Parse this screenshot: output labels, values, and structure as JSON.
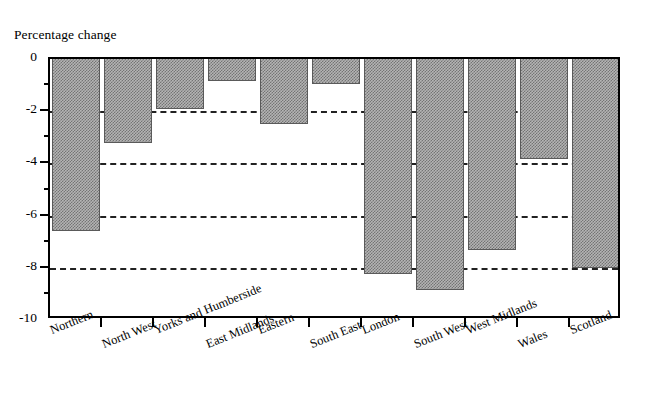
{
  "chart_data": {
    "type": "bar",
    "title": "",
    "ylabel": "Percentage change",
    "xlabel": "",
    "categories": [
      "Northern",
      "North West",
      "Yorks and Humberside",
      "East Midlands",
      "Eastern",
      "South East",
      "London",
      "South West",
      "West Midlands",
      "Wales",
      "Scotland"
    ],
    "values": [
      -6.6,
      -3.2,
      -1.9,
      -0.85,
      -2.5,
      -0.95,
      -8.25,
      -8.85,
      -7.3,
      -3.85,
      -8.0
    ],
    "ylim": [
      -10,
      0
    ],
    "ytick_labels": [
      "0",
      "-2",
      "-4",
      "-6",
      "-8",
      "-10"
    ],
    "ytick_values": [
      0,
      -2,
      -4,
      -6,
      -8,
      -10
    ],
    "yminor_ticks": [
      -1,
      -3,
      -5,
      -7,
      -9
    ],
    "gridlines": [
      -2,
      -4,
      -6,
      -8
    ],
    "grid": "horizontal-dashed",
    "legend": "none",
    "bar_fill_color": "#b4b4b4",
    "bar_pattern": "checkerboard-dither",
    "bar_edge_color": "#5a5a5a",
    "axis_color": "#000000",
    "background_color": "#ffffff",
    "label_rotation_degrees": -22
  }
}
